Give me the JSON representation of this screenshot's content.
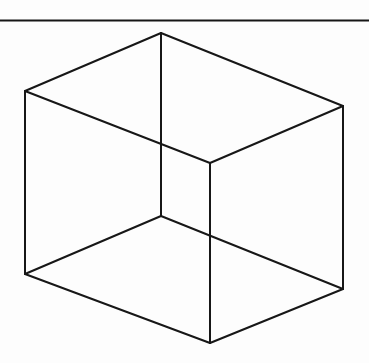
{
  "page": {
    "width": 369,
    "height": 363,
    "background_color": "#fdfdfd",
    "ink_color": "#171717"
  },
  "divider": {
    "name": "horizontal-rule",
    "x1": 0,
    "y1": 20.5,
    "x2": 369,
    "y2": 20.5,
    "thickness": 2.1,
    "color": "#161616"
  },
  "figure": {
    "name": "necker-cube",
    "type": "wireframe-cube",
    "stroke_color": "#171717",
    "stroke_width": 2.0,
    "vertices": {
      "top_apex": [
        161,
        33
      ],
      "top_left": [
        25,
        91
      ],
      "top_right": [
        343,
        106
      ],
      "interior_back": [
        210,
        163
      ],
      "interior_front": [
        161,
        216
      ],
      "bottom_left": [
        25,
        274
      ],
      "bottom_right": [
        343,
        289
      ],
      "bottom_apex": [
        210,
        343
      ]
    },
    "edges": [
      {
        "name": "edge-top-left-upper",
        "from": "top_apex",
        "to": "top_left"
      },
      {
        "name": "edge-top-right-upper",
        "from": "top_apex",
        "to": "top_right"
      },
      {
        "name": "edge-left-vertical",
        "from": "top_left",
        "to": "bottom_left"
      },
      {
        "name": "edge-right-vertical",
        "from": "top_right",
        "to": "bottom_right"
      },
      {
        "name": "edge-bottom-left-lower",
        "from": "bottom_left",
        "to": "bottom_apex"
      },
      {
        "name": "edge-bottom-right-lower",
        "from": "bottom_right",
        "to": "bottom_apex"
      },
      {
        "name": "edge-center-upper-vertical",
        "from": "top_apex",
        "to": "interior_front"
      },
      {
        "name": "edge-center-lower-vertical",
        "from": "interior_back",
        "to": "bottom_apex"
      },
      {
        "name": "edge-interior-back-to-left",
        "from": "interior_back",
        "to": "top_left"
      },
      {
        "name": "edge-interior-back-to-right",
        "from": "interior_back",
        "to": "top_right"
      },
      {
        "name": "edge-interior-front-to-left",
        "from": "interior_front",
        "to": "bottom_left"
      },
      {
        "name": "edge-interior-front-to-right",
        "from": "interior_front",
        "to": "bottom_right"
      }
    ],
    "crossings": [
      {
        "name": "crossing-upper",
        "at": [
          161,
          145
        ]
      },
      {
        "name": "crossing-lower",
        "at": [
          210,
          235
        ]
      }
    ]
  }
}
